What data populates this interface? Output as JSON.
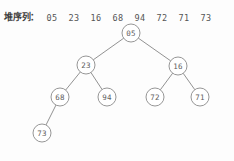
{
  "header": {
    "label": "堆序列",
    "colon": "：",
    "sequence": [
      "05",
      "23",
      "16",
      "68",
      "94",
      "72",
      "71",
      "73"
    ]
  },
  "tree": {
    "nodes": [
      {
        "id": "n0",
        "label": "05",
        "x": 131,
        "y": 15,
        "level": 0
      },
      {
        "id": "n1",
        "label": "23",
        "x": 86,
        "y": 47,
        "level": 1
      },
      {
        "id": "n2",
        "label": "16",
        "x": 178,
        "y": 48,
        "level": 1
      },
      {
        "id": "n3",
        "label": "68",
        "x": 60,
        "y": 79,
        "level": 2
      },
      {
        "id": "n4",
        "label": "94",
        "x": 107,
        "y": 79,
        "level": 2
      },
      {
        "id": "n5",
        "label": "72",
        "x": 155,
        "y": 79,
        "level": 2
      },
      {
        "id": "n6",
        "label": "71",
        "x": 200,
        "y": 79,
        "level": 2
      },
      {
        "id": "n7",
        "label": "73",
        "x": 42,
        "y": 115,
        "level": 3
      }
    ],
    "edges": [
      {
        "from": "n0",
        "to": "n1"
      },
      {
        "from": "n0",
        "to": "n2"
      },
      {
        "from": "n1",
        "to": "n3"
      },
      {
        "from": "n1",
        "to": "n4"
      },
      {
        "from": "n2",
        "to": "n5"
      },
      {
        "from": "n2",
        "to": "n6"
      },
      {
        "from": "n3",
        "to": "n7"
      }
    ],
    "node_radius": 9,
    "colors": {
      "node_stroke": "#8a8a8a",
      "node_fill": "#ffffff",
      "edge": "#7e7e7e",
      "text": "#5e5e5e"
    }
  }
}
